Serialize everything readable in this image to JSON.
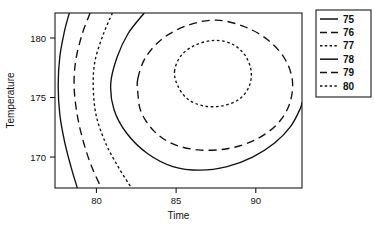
{
  "figure": {
    "background": "#ffffff",
    "ink_color": "#111111"
  },
  "chart_data": {
    "type": "line",
    "chart_subtype": "contour",
    "title": "",
    "xlabel": "Time",
    "ylabel": "Temperature",
    "xlim": [
      77.4,
      92.9
    ],
    "ylim": [
      167.4,
      182.1
    ],
    "xticks": [
      80,
      85,
      90
    ],
    "xtick_labels": [
      "80",
      "85",
      "90"
    ],
    "yticks": [
      170,
      175,
      180
    ],
    "ytick_labels": [
      "170",
      "175",
      "180"
    ],
    "grid": false,
    "legend_position": "right",
    "legend_title": "",
    "levels": [
      75,
      76,
      77,
      78,
      79,
      80
    ],
    "level_labels": [
      "75",
      "76",
      "77",
      "78",
      "79",
      "80"
    ],
    "line_styles": [
      "solid",
      "long-dash",
      "short-dash",
      "solid",
      "long-dash",
      "short-dash"
    ],
    "peak_center": [
      87.0,
      177.0
    ],
    "peak_level_inner": 80,
    "series": [
      {
        "name": "75",
        "level": 75,
        "style": "solid",
        "dasharray": "none",
        "closed": false,
        "points": [
          [
            78.3,
            182.1
          ],
          [
            78.0,
            180.6
          ],
          [
            77.7,
            178.4
          ],
          [
            77.6,
            176.0
          ],
          [
            77.7,
            173.6
          ],
          [
            78.0,
            171.3
          ],
          [
            78.4,
            169.2
          ],
          [
            78.8,
            167.4
          ]
        ]
      },
      {
        "name": "76",
        "level": 76,
        "style": "long-dash",
        "dasharray": "8,5",
        "closed": false,
        "points": [
          [
            79.6,
            182.1
          ],
          [
            79.1,
            180.3
          ],
          [
            78.7,
            178.1
          ],
          [
            78.6,
            175.9
          ],
          [
            78.8,
            173.5
          ],
          [
            79.2,
            171.2
          ],
          [
            79.7,
            169.2
          ],
          [
            80.3,
            167.4
          ]
        ]
      },
      {
        "name": "77",
        "level": 77,
        "style": "short-dash",
        "dasharray": "2.6,2.6",
        "closed": false,
        "points": [
          [
            81.0,
            182.1
          ],
          [
            80.4,
            180.2
          ],
          [
            79.9,
            178.0
          ],
          [
            79.8,
            175.8
          ],
          [
            80.0,
            173.4
          ],
          [
            80.6,
            171.1
          ],
          [
            81.4,
            169.1
          ],
          [
            82.2,
            167.4
          ]
        ]
      },
      {
        "name": "78",
        "level": 78,
        "style": "solid",
        "dasharray": "none",
        "closed": false,
        "points": [
          [
            83.0,
            182.1
          ],
          [
            82.0,
            180.4
          ],
          [
            81.3,
            178.4
          ],
          [
            80.9,
            176.2
          ],
          [
            81.1,
            174.0
          ],
          [
            81.9,
            172.0
          ],
          [
            83.2,
            170.3
          ],
          [
            84.8,
            169.2
          ],
          [
            86.5,
            168.9
          ],
          [
            88.2,
            169.2
          ],
          [
            89.8,
            170.0
          ],
          [
            91.2,
            171.2
          ],
          [
            92.2,
            172.6
          ],
          [
            92.8,
            174.1
          ],
          [
            92.9,
            174.6
          ]
        ]
      },
      {
        "name": "79",
        "level": 79,
        "style": "long-dash",
        "dasharray": "8,5",
        "closed": true,
        "points": [
          [
            82.6,
            176.6
          ],
          [
            83.1,
            178.4
          ],
          [
            84.2,
            180.0
          ],
          [
            85.8,
            181.1
          ],
          [
            87.5,
            181.5
          ],
          [
            89.2,
            181.0
          ],
          [
            90.7,
            179.9
          ],
          [
            91.8,
            178.3
          ],
          [
            92.3,
            176.4
          ],
          [
            92.1,
            174.4
          ],
          [
            91.3,
            172.7
          ],
          [
            89.9,
            171.4
          ],
          [
            88.2,
            170.7
          ],
          [
            86.4,
            170.6
          ],
          [
            84.8,
            171.1
          ],
          [
            83.6,
            172.2
          ],
          [
            82.8,
            173.8
          ],
          [
            82.6,
            175.4
          ]
        ]
      },
      {
        "name": "80",
        "level": 80,
        "style": "short-dash",
        "dasharray": "2.6,2.6",
        "closed": true,
        "points": [
          [
            84.9,
            177.2
          ],
          [
            85.3,
            178.5
          ],
          [
            86.2,
            179.4
          ],
          [
            87.4,
            179.8
          ],
          [
            88.5,
            179.5
          ],
          [
            89.3,
            178.6
          ],
          [
            89.7,
            177.3
          ],
          [
            89.6,
            176.0
          ],
          [
            89.0,
            174.9
          ],
          [
            87.9,
            174.3
          ],
          [
            86.7,
            174.3
          ],
          [
            85.7,
            174.9
          ],
          [
            85.1,
            176.0
          ]
        ]
      }
    ]
  },
  "plot_frame": {
    "left_px": 55,
    "top_px": 13,
    "right_px": 302,
    "bottom_px": 188
  },
  "legend": {
    "box": {
      "left_px": 316,
      "top_px": 10,
      "right_px": 371,
      "bottom_px": 97
    },
    "entries": [
      {
        "label": "75",
        "style": "solid"
      },
      {
        "label": "76",
        "style": "long-dash"
      },
      {
        "label": "77",
        "style": "short-dash"
      },
      {
        "label": "78",
        "style": "solid"
      },
      {
        "label": "79",
        "style": "long-dash"
      },
      {
        "label": "80",
        "style": "short-dash"
      }
    ]
  }
}
